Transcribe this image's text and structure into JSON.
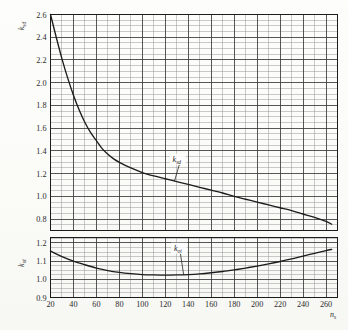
{
  "figure": {
    "kind": "engineering-coefficient-chart",
    "background_hex": "#fbfbf8",
    "ink_hex": "#1c1c1c",
    "grid_minor_hex": "#8c8c8c",
    "grid_major_hex": "#3a3a3a"
  },
  "axes": {
    "x": {
      "name": "n",
      "name_sub": "s",
      "ticks": [
        20,
        40,
        60,
        80,
        100,
        120,
        140,
        160,
        180,
        200,
        220,
        240,
        260
      ],
      "tick_labels": [
        "20",
        "40",
        "60",
        "80",
        "100",
        "120",
        "140",
        "160",
        "180",
        "200",
        "220",
        "240",
        "260"
      ],
      "min": 20,
      "max": 270,
      "minor_step": 10
    },
    "y_upper": {
      "name": "k",
      "name_sub": "sd",
      "ticks": [
        0.8,
        1.0,
        1.2,
        1.4,
        1.6,
        1.8,
        2.0,
        2.2,
        2.4,
        2.6
      ],
      "tick_labels": [
        "0.8",
        "1.0",
        "1.2",
        "1.4",
        "1.6",
        "1.8",
        "2.0",
        "2.2",
        "2.4",
        "2.6"
      ],
      "min": 0.7,
      "max": 2.6,
      "minor_step": 0.05
    },
    "y_lower": {
      "name": "k",
      "name_sub": "ot",
      "ticks": [
        0.9,
        1.0,
        1.1,
        1.2
      ],
      "tick_labels": [
        "0.9",
        "1.0",
        "1.1",
        "1.2"
      ],
      "min": 0.9,
      "max": 1.23,
      "minor_step": 0.025
    }
  },
  "chart_data": {
    "type": "line",
    "title": "",
    "subtitle": "",
    "xlabel": "n_s",
    "ylabel": "k_sd (upper panel), k_ot (lower panel)",
    "xlim": [
      20,
      270
    ],
    "grid": true,
    "legend": "inline-labels-with-leader-lines",
    "panels": [
      {
        "name": "upper",
        "ylabel": "k_sd",
        "ylim": [
          0.7,
          2.6
        ],
        "series": [
          {
            "name": "k_sd",
            "label": "k",
            "label_sub": "sd",
            "x": [
              20,
              25,
              30,
              35,
              40,
              45,
              50,
              55,
              60,
              65,
              70,
              75,
              80,
              90,
              100,
              110,
              120,
              130,
              140,
              150,
              160,
              170,
              180,
              190,
              200,
              210,
              220,
              230,
              240,
              250,
              260,
              265
            ],
            "values": [
              2.6,
              2.4,
              2.21,
              2.04,
              1.89,
              1.76,
              1.65,
              1.56,
              1.49,
              1.42,
              1.37,
              1.33,
              1.3,
              1.25,
              1.21,
              1.18,
              1.155,
              1.13,
              1.105,
              1.08,
              1.055,
              1.03,
              1.0,
              0.975,
              0.95,
              0.925,
              0.9,
              0.875,
              0.845,
              0.815,
              0.78,
              0.755
            ],
            "label_anchor": {
              "x": 130,
              "y": 1.3
            },
            "leader_to": {
              "x": 128,
              "y": 1.135
            }
          }
        ]
      },
      {
        "name": "lower",
        "ylabel": "k_ot",
        "ylim": [
          0.9,
          1.23
        ],
        "series": [
          {
            "name": "k_ot",
            "label": "k",
            "label_sub": "ot",
            "x": [
              20,
              30,
              40,
              50,
              60,
              70,
              80,
              90,
              100,
              110,
              120,
              130,
              140,
              150,
              160,
              170,
              180,
              190,
              200,
              210,
              220,
              230,
              240,
              250,
              260,
              265
            ],
            "values": [
              1.155,
              1.125,
              1.1,
              1.08,
              1.062,
              1.048,
              1.038,
              1.031,
              1.026,
              1.024,
              1.023,
              1.024,
              1.026,
              1.03,
              1.036,
              1.043,
              1.052,
              1.062,
              1.073,
              1.085,
              1.098,
              1.112,
              1.128,
              1.143,
              1.158,
              1.165
            ],
            "label_anchor": {
              "x": 131,
              "y": 1.155
            },
            "leader_to": {
              "x": 136,
              "y": 1.0255
            }
          }
        ]
      }
    ]
  }
}
